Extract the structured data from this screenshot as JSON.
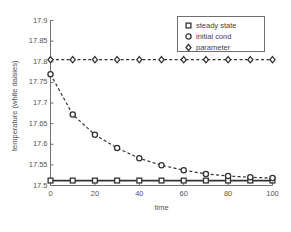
{
  "chart_data": {
    "type": "line",
    "title": "",
    "xlabel": "time",
    "ylabel": "temperature (white daisies)",
    "xlim": [
      0,
      100
    ],
    "ylim": [
      17.5,
      17.9
    ],
    "xticks": [
      0,
      20,
      40,
      60,
      80,
      100
    ],
    "yticks": [
      17.5,
      17.55,
      17.6,
      17.65,
      17.7,
      17.75,
      17.8,
      17.85,
      17.9
    ],
    "xtick_labels": [
      "0",
      "20",
      "40",
      "60",
      "80",
      "100"
    ],
    "ytick_labels": [
      "17.5",
      "17.55",
      "17.6",
      "17.65",
      "17.7",
      "17.75",
      "17.8",
      "17.85",
      "17.9"
    ],
    "grid": false,
    "legend_position": "upper right",
    "x": [
      0,
      10,
      20,
      30,
      40,
      50,
      60,
      70,
      80,
      90,
      100
    ],
    "series": [
      {
        "name": "steady state",
        "marker": "square",
        "linestyle": "solid",
        "color": "#333333",
        "values": [
          17.512,
          17.512,
          17.512,
          17.512,
          17.512,
          17.512,
          17.512,
          17.512,
          17.512,
          17.512,
          17.512
        ]
      },
      {
        "name": "initial cond",
        "marker": "circle",
        "linestyle": "dashed",
        "color": "#333333",
        "values": [
          17.77,
          17.672,
          17.623,
          17.591,
          17.566,
          17.549,
          17.537,
          17.528,
          17.523,
          17.52,
          17.518
        ]
      },
      {
        "name": "parameter",
        "marker": "diamond",
        "linestyle": "dashed",
        "color": "#333333",
        "values": [
          17.805,
          17.805,
          17.805,
          17.805,
          17.805,
          17.805,
          17.805,
          17.805,
          17.805,
          17.805,
          17.805
        ]
      }
    ]
  },
  "legend": {
    "entries": [
      {
        "label": "steady state",
        "marker": "square-marker-icon"
      },
      {
        "label": "initial cond",
        "marker": "circle-marker-icon"
      },
      {
        "label": "parameter",
        "marker": "diamond-marker-icon"
      }
    ]
  },
  "axes": {
    "x_axis_label": "time",
    "y_axis_label": "temperature (white daisies)"
  },
  "colors": {
    "axis": "#6f6f6f",
    "line": "#333333",
    "marker_fill": "#ffffff",
    "text": "#555555",
    "background": "#ffffff"
  }
}
